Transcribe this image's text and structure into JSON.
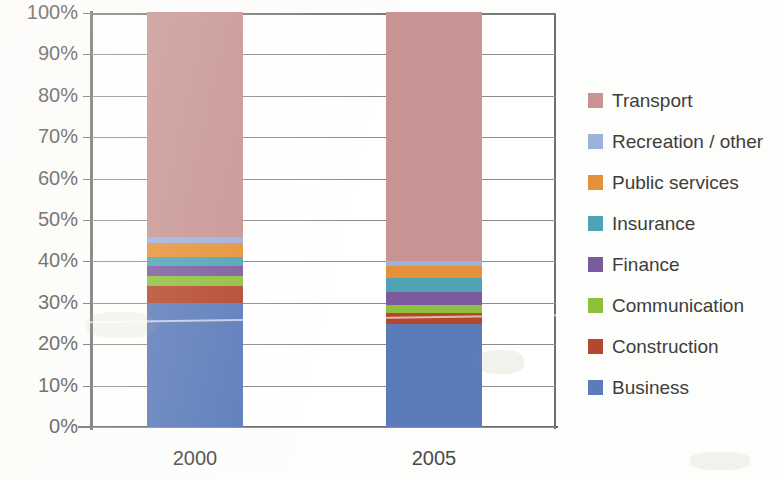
{
  "chart_data": {
    "type": "bar",
    "subtype": "stacked-100-percent",
    "title": "",
    "xlabel": "",
    "ylabel": "",
    "categories": [
      "2000",
      "2005"
    ],
    "ylim": [
      0,
      100
    ],
    "ytick_labels": [
      "100%",
      "90%",
      "80%",
      "70%",
      "60%",
      "50%",
      "40%",
      "30%",
      "20%",
      "10%",
      "0%"
    ],
    "ytick_values": [
      100,
      90,
      80,
      70,
      60,
      50,
      40,
      30,
      20,
      10,
      0
    ],
    "grid": true,
    "legend_position": "right",
    "stack_order_bottom_to_top": [
      "Business",
      "Construction",
      "Communication",
      "Finance",
      "Insurance",
      "Public services",
      "Recreation / other",
      "Transport"
    ],
    "series": [
      {
        "name": "Business",
        "color": "#5b7bba",
        "values": [
          30.0,
          25.0
        ]
      },
      {
        "name": "Construction",
        "color": "#b4472e",
        "values": [
          4.0,
          2.5
        ]
      },
      {
        "name": "Communication",
        "color": "#8fbf3f",
        "values": [
          2.5,
          2.0
        ]
      },
      {
        "name": "Finance",
        "color": "#7b5b9e",
        "values": [
          2.5,
          3.0
        ]
      },
      {
        "name": "Insurance",
        "color": "#4fa3b5",
        "values": [
          2.0,
          3.5
        ]
      },
      {
        "name": "Public services",
        "color": "#e69138",
        "values": [
          3.5,
          3.0
        ]
      },
      {
        "name": "Recreation / other",
        "color": "#9eb0dc",
        "values": [
          1.5,
          1.0
        ]
      },
      {
        "name": "Transport",
        "color": "#c79393",
        "values": [
          54.0,
          60.0
        ]
      }
    ]
  },
  "legend": {
    "items": [
      {
        "label": "Transport",
        "color": "#c79393"
      },
      {
        "label": "Recreation / other",
        "color": "#9eb0dc"
      },
      {
        "label": "Public services",
        "color": "#e69138"
      },
      {
        "label": "Insurance",
        "color": "#4fa3b5"
      },
      {
        "label": "Finance",
        "color": "#7b5b9e"
      },
      {
        "label": "Communication",
        "color": "#8fbf3f"
      },
      {
        "label": "Construction",
        "color": "#b4472e"
      },
      {
        "label": "Business",
        "color": "#5b7bba"
      }
    ]
  },
  "axes": {
    "grid_color": "#8d8d8d",
    "axis_color": "#6e6e6e",
    "label_color": "#4a4a48",
    "plot_background": "#ffffff"
  }
}
